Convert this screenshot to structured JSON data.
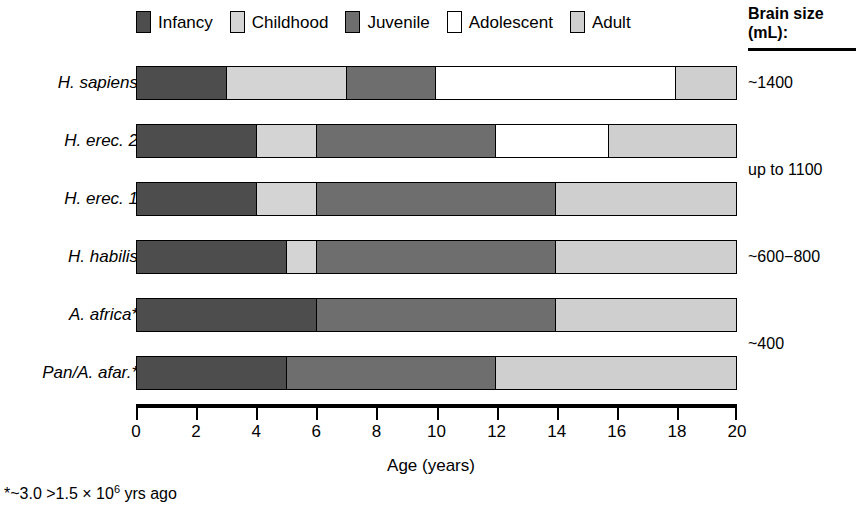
{
  "chart_data": {
    "type": "bar",
    "orientation": "horizontal",
    "stacked": true,
    "title": "",
    "xlabel": "Age (years)",
    "ylabel": "",
    "xlim": [
      0,
      20
    ],
    "xticks": [
      0,
      2,
      4,
      6,
      8,
      10,
      12,
      14,
      16,
      18,
      20
    ],
    "xtick_labels": [
      "0",
      "2",
      "4",
      "6",
      "8",
      "10",
      "12",
      "14",
      "16",
      "18",
      "20"
    ],
    "grid": false,
    "legend_position": "top",
    "stages": [
      "Infancy",
      "Childhood",
      "Juvenile",
      "Adolescent",
      "Adult"
    ],
    "stage_colors": {
      "Infancy": "#4d4d4d",
      "Childhood": "#d4d4d4",
      "Juvenile": "#6e6e6e",
      "Adolescent": "#ffffff",
      "Adult": "#cfcfcf"
    },
    "categories": [
      "H. sapiens",
      "H. erec. 2",
      "H. erec. 1",
      "H. habilis",
      "A. africa*",
      "Pan/A. afar.*"
    ],
    "series": [
      {
        "name": "Infancy",
        "values": [
          3.0,
          4.0,
          4.0,
          5.0,
          6.0,
          5.0
        ]
      },
      {
        "name": "Childhood",
        "values": [
          4.0,
          2.0,
          2.0,
          1.0,
          0.0,
          0.0
        ]
      },
      {
        "name": "Juvenile",
        "values": [
          3.0,
          6.0,
          8.0,
          8.0,
          8.0,
          7.0
        ]
      },
      {
        "name": "Adolescent",
        "values": [
          8.0,
          3.75,
          0.0,
          0.0,
          0.0,
          0.0
        ]
      },
      {
        "name": "Adult",
        "values": [
          2.0,
          4.25,
          6.0,
          6.0,
          6.0,
          8.0
        ]
      }
    ],
    "boundaries": {
      "H. sapiens": [
        0,
        3,
        7,
        10,
        18,
        20
      ],
      "H. erec. 2": [
        0,
        4,
        6,
        12,
        15.75,
        20
      ],
      "H. erec. 1": [
        0,
        4,
        6,
        14,
        14,
        20
      ],
      "H. habilis": [
        0,
        5,
        6,
        14,
        14,
        20
      ],
      "A. africa*": [
        0,
        6,
        6,
        14,
        14,
        20
      ],
      "Pan/A. afar.*": [
        0,
        5,
        5,
        12,
        12,
        20
      ]
    },
    "annotations": {
      "brain_size_header": "Brain size (mL):",
      "brain_size_values": [
        "~1400",
        "up to 1100",
        "~600−800",
        "~400"
      ],
      "footnote": "*~3.0 >1.5 × 10⁶ yrs ago"
    }
  },
  "legend": {
    "items": [
      {
        "label": "Infancy",
        "color": "#4d4d4d"
      },
      {
        "label": "Childhood",
        "color": "#d4d4d4"
      },
      {
        "label": "Juvenile",
        "color": "#6e6e6e"
      },
      {
        "label": "Adolescent",
        "color": "#ffffff"
      },
      {
        "label": "Adult",
        "color": "#cfcfcf"
      }
    ]
  },
  "rows": [
    {
      "label": "H. sapiens",
      "segments": [
        {
          "stage": "Infancy",
          "start": 0,
          "end": 3,
          "color": "#4d4d4d"
        },
        {
          "stage": "Childhood",
          "start": 3,
          "end": 7,
          "color": "#d4d4d4"
        },
        {
          "stage": "Juvenile",
          "start": 7,
          "end": 10,
          "color": "#6e6e6e"
        },
        {
          "stage": "Adolescent",
          "start": 10,
          "end": 18,
          "color": "#ffffff"
        },
        {
          "stage": "Adult",
          "start": 18,
          "end": 20,
          "color": "#cfcfcf"
        }
      ]
    },
    {
      "label": "H. erec. 2",
      "segments": [
        {
          "stage": "Infancy",
          "start": 0,
          "end": 4,
          "color": "#4d4d4d"
        },
        {
          "stage": "Childhood",
          "start": 4,
          "end": 6,
          "color": "#d4d4d4"
        },
        {
          "stage": "Juvenile",
          "start": 6,
          "end": 12,
          "color": "#6e6e6e"
        },
        {
          "stage": "Adolescent",
          "start": 12,
          "end": 15.75,
          "color": "#ffffff"
        },
        {
          "stage": "Adult",
          "start": 15.75,
          "end": 20,
          "color": "#cfcfcf"
        }
      ]
    },
    {
      "label": "H. erec. 1",
      "segments": [
        {
          "stage": "Infancy",
          "start": 0,
          "end": 4,
          "color": "#4d4d4d"
        },
        {
          "stage": "Childhood",
          "start": 4,
          "end": 6,
          "color": "#d4d4d4"
        },
        {
          "stage": "Juvenile",
          "start": 6,
          "end": 14,
          "color": "#6e6e6e"
        },
        {
          "stage": "Adult",
          "start": 14,
          "end": 20,
          "color": "#cfcfcf"
        }
      ]
    },
    {
      "label": "H. habilis",
      "segments": [
        {
          "stage": "Infancy",
          "start": 0,
          "end": 5,
          "color": "#4d4d4d"
        },
        {
          "stage": "Childhood",
          "start": 5,
          "end": 6,
          "color": "#d4d4d4"
        },
        {
          "stage": "Juvenile",
          "start": 6,
          "end": 14,
          "color": "#6e6e6e"
        },
        {
          "stage": "Adult",
          "start": 14,
          "end": 20,
          "color": "#cfcfcf"
        }
      ]
    },
    {
      "label": "A. africa*",
      "segments": [
        {
          "stage": "Infancy",
          "start": 0,
          "end": 6,
          "color": "#4d4d4d"
        },
        {
          "stage": "Juvenile",
          "start": 6,
          "end": 14,
          "color": "#6e6e6e"
        },
        {
          "stage": "Adult",
          "start": 14,
          "end": 20,
          "color": "#cfcfcf"
        }
      ]
    },
    {
      "label": "Pan/A. afar.*",
      "segments": [
        {
          "stage": "Infancy",
          "start": 0,
          "end": 5,
          "color": "#4d4d4d"
        },
        {
          "stage": "Juvenile",
          "start": 5,
          "end": 12,
          "color": "#6e6e6e"
        },
        {
          "stage": "Adult",
          "start": 12,
          "end": 20,
          "color": "#cfcfcf"
        }
      ]
    }
  ],
  "brain_size": {
    "title_line1": "Brain size",
    "title_line2": "(mL):",
    "values": [
      {
        "text": "~1400",
        "row_index": 0
      },
      {
        "text": "up to 1100",
        "row_index": 1.5
      },
      {
        "text": "~600−800",
        "row_index": 3
      },
      {
        "text": "~400",
        "row_index": 4.5
      }
    ]
  },
  "axis": {
    "min": 0,
    "max": 20,
    "ticks": [
      "0",
      "2",
      "4",
      "6",
      "8",
      "10",
      "12",
      "14",
      "16",
      "18",
      "20"
    ],
    "title": "Age (years)"
  },
  "footnote": {
    "prefix": "*~3.0 >1.5 × 10",
    "exponent": "6",
    "suffix": " yrs ago"
  }
}
